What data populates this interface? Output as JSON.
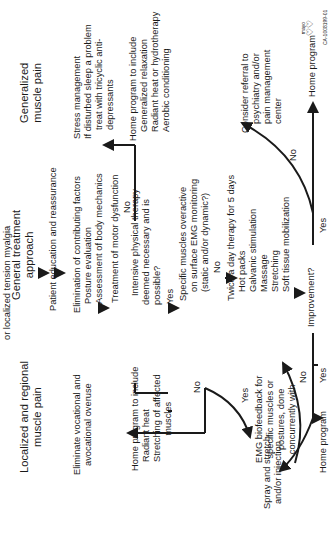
{
  "diagram": {
    "header_fragment": "or localized tension myalgia",
    "left_branch": {
      "title": "Localized and regional muscle pain",
      "title_lines": [
        "Localized and regional",
        "muscle pain"
      ],
      "step1_lines": [
        "Eliminate vocational and",
        "avocational overuse"
      ],
      "home_program_lines": [
        "Home program to include",
        "Radiant heat",
        "Stretching of affected",
        "muscles"
      ],
      "emg_lines": [
        "EMG biofeedback for",
        "specific muscles or",
        "postures, done",
        "concurrently with"
      ],
      "spray_lines": [
        "Spray and stretch",
        "and/or injection"
      ],
      "home_program_short": "Home program"
    },
    "center_branch": {
      "title_lines": [
        "General treatment",
        "approach"
      ],
      "education": "Patient education and reassurance",
      "factors_lines": [
        "Elimination of contributing factors",
        "Posture evaluation",
        "Assessment of body mechanics"
      ],
      "motor": "Treatment of motor dysfunction",
      "intensive_lines": [
        "Intensive physical therapy",
        "deemed necessary and is",
        "possible?"
      ],
      "specific_lines": [
        "Specific muscles overactive",
        "on surface EMG monitoring",
        "(static and/or dynamic?)"
      ],
      "twice_lines": [
        "Twice a day therapy for 5 days",
        "Hot packs",
        "Galvanic stimulation",
        "Massage",
        "Stretching",
        "Soft tissue mobilization"
      ],
      "improvement": "Improvement?"
    },
    "right_branch": {
      "title_lines": [
        "Generalized",
        "muscle pain"
      ],
      "stress_lines": [
        "Stress management",
        "If disturbed sleep a problem",
        "treat with tricyclic anti-",
        "depressants"
      ],
      "home_program_lines": [
        "Home program to include",
        "Generalized relaxation",
        "Radiant heat or hydrotherapy",
        "Aerobic conditioning"
      ],
      "referral_lines": [
        "Consider referral to",
        "psychiatry and/or",
        "pain management",
        "center"
      ],
      "home_program_short": "Home program"
    },
    "labels": {
      "yes": "Yes",
      "no": "No"
    },
    "logo": {
      "name": "mayo",
      "code": "CA-1008199-01"
    },
    "colors": {
      "ink": "#1a1a1a",
      "background": "#ffffff"
    }
  }
}
